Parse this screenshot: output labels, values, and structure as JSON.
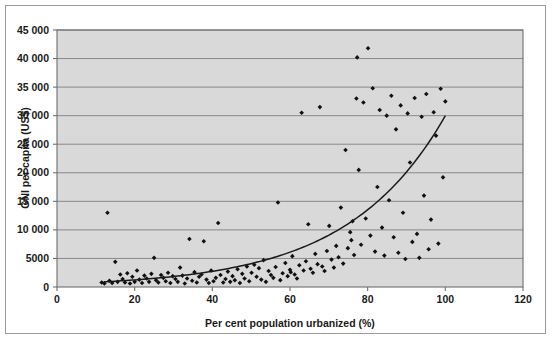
{
  "figure": {
    "background_color": "#ffffff",
    "border_color": "#9a9a9a",
    "plot_background_color": "#d9d9d9",
    "gridline_color": "#808080",
    "axis_color": "#6e6e6e",
    "marker_color": "#101010",
    "trendline_color": "#1a1a1a"
  },
  "chart_data": {
    "type": "scatter",
    "title": "",
    "xlabel": "Per cent population urbanized (%)",
    "ylabel": "GNI per capita (US$)",
    "xlim": [
      0,
      120
    ],
    "ylim": [
      0,
      45000
    ],
    "xticks": [
      0,
      20,
      40,
      60,
      80,
      100,
      120
    ],
    "xtick_labels": [
      "0",
      "20",
      "40",
      "60",
      "80",
      "100",
      "120"
    ],
    "yticks": [
      0,
      5000,
      10000,
      15000,
      20000,
      25000,
      30000,
      35000,
      40000,
      45000
    ],
    "ytick_labels": [
      "0",
      "5000",
      "10 000",
      "15 000",
      "20 000",
      "25 000",
      "30 000",
      "35 000",
      "40 000",
      "45 000"
    ],
    "grid": "horizontal",
    "legend": "none",
    "marker": "diamond",
    "series": [
      {
        "name": "Countries",
        "points": [
          [
            11.5,
            800
          ],
          [
            12.2,
            600
          ],
          [
            13.0,
            13000
          ],
          [
            13.5,
            1100
          ],
          [
            14.2,
            700
          ],
          [
            15.0,
            4400
          ],
          [
            15.6,
            900
          ],
          [
            16.3,
            2200
          ],
          [
            16.9,
            1400
          ],
          [
            17.5,
            800
          ],
          [
            18.1,
            2400
          ],
          [
            18.8,
            600
          ],
          [
            19.4,
            1800
          ],
          [
            20.0,
            900
          ],
          [
            20.6,
            2900
          ],
          [
            21.2,
            1300
          ],
          [
            21.9,
            700
          ],
          [
            22.5,
            2000
          ],
          [
            23.1,
            1500
          ],
          [
            23.7,
            900
          ],
          [
            24.3,
            2300
          ],
          [
            25.0,
            5100
          ],
          [
            25.5,
            1200
          ],
          [
            26.1,
            800
          ],
          [
            26.8,
            2100
          ],
          [
            27.4,
            1600
          ],
          [
            28.0,
            1000
          ],
          [
            28.6,
            2500
          ],
          [
            29.2,
            700
          ],
          [
            29.8,
            1900
          ],
          [
            30.5,
            1400
          ],
          [
            31.1,
            900
          ],
          [
            31.7,
            3400
          ],
          [
            32.3,
            2000
          ],
          [
            32.9,
            600
          ],
          [
            33.5,
            1500
          ],
          [
            34.1,
            8400
          ],
          [
            34.8,
            1100
          ],
          [
            35.4,
            2600
          ],
          [
            36.0,
            800
          ],
          [
            36.6,
            1800
          ],
          [
            37.2,
            2200
          ],
          [
            37.8,
            8000
          ],
          [
            38.5,
            1300
          ],
          [
            39.1,
            700
          ],
          [
            39.7,
            2900
          ],
          [
            40.3,
            1000
          ],
          [
            40.9,
            1600
          ],
          [
            41.5,
            11200
          ],
          [
            42.1,
            2100
          ],
          [
            42.8,
            800
          ],
          [
            43.4,
            1400
          ],
          [
            44.0,
            2700
          ],
          [
            44.6,
            900
          ],
          [
            45.2,
            1900
          ],
          [
            45.8,
            1200
          ],
          [
            46.5,
            3100
          ],
          [
            47.1,
            700
          ],
          [
            47.7,
            2300
          ],
          [
            48.3,
            1500
          ],
          [
            48.9,
            3600
          ],
          [
            49.5,
            1000
          ],
          [
            50.1,
            2500
          ],
          [
            50.8,
            3900
          ],
          [
            51.4,
            1800
          ],
          [
            52.0,
            3300
          ],
          [
            52.6,
            1300
          ],
          [
            53.2,
            4700
          ],
          [
            53.8,
            900
          ],
          [
            54.5,
            2800
          ],
          [
            55.1,
            2100
          ],
          [
            55.7,
            1600
          ],
          [
            56.3,
            3500
          ],
          [
            56.9,
            14800
          ],
          [
            57.5,
            1200
          ],
          [
            58.1,
            2400
          ],
          [
            58.8,
            4200
          ],
          [
            59.4,
            1900
          ],
          [
            60.0,
            3000
          ],
          [
            60.2,
            2600
          ],
          [
            60.6,
            5400
          ],
          [
            61.2,
            2200
          ],
          [
            61.8,
            1500
          ],
          [
            62.4,
            3800
          ],
          [
            63.0,
            30500
          ],
          [
            63.5,
            2900
          ],
          [
            64.1,
            4500
          ],
          [
            64.7,
            11000
          ],
          [
            65.3,
            3200
          ],
          [
            65.9,
            2500
          ],
          [
            66.5,
            5800
          ],
          [
            67.1,
            4000
          ],
          [
            67.7,
            31500
          ],
          [
            68.3,
            3600
          ],
          [
            68.9,
            2800
          ],
          [
            69.5,
            6300
          ],
          [
            70.1,
            10700
          ],
          [
            70.7,
            4800
          ],
          [
            71.3,
            3400
          ],
          [
            71.9,
            7200
          ],
          [
            72.5,
            5200
          ],
          [
            73.1,
            13900
          ],
          [
            73.7,
            4100
          ],
          [
            74.3,
            24000
          ],
          [
            74.9,
            6800
          ],
          [
            75.5,
            9600
          ],
          [
            75.8,
            8200
          ],
          [
            76.1,
            11500
          ],
          [
            76.5,
            5600
          ],
          [
            77.1,
            33000
          ],
          [
            77.3,
            40200
          ],
          [
            77.7,
            20500
          ],
          [
            78.3,
            7400
          ],
          [
            78.9,
            32300
          ],
          [
            79.5,
            12000
          ],
          [
            80.1,
            41800
          ],
          [
            80.7,
            9000
          ],
          [
            81.3,
            34800
          ],
          [
            81.9,
            6200
          ],
          [
            82.5,
            17500
          ],
          [
            83.1,
            31000
          ],
          [
            83.7,
            10400
          ],
          [
            84.3,
            5500
          ],
          [
            84.9,
            30000
          ],
          [
            85.5,
            15200
          ],
          [
            86.1,
            33500
          ],
          [
            86.7,
            8700
          ],
          [
            87.3,
            27600
          ],
          [
            87.9,
            6000
          ],
          [
            88.5,
            31800
          ],
          [
            89.1,
            13000
          ],
          [
            89.7,
            4900
          ],
          [
            90.3,
            30400
          ],
          [
            90.9,
            21800
          ],
          [
            91.5,
            7900
          ],
          [
            92.1,
            33100
          ],
          [
            92.7,
            9300
          ],
          [
            93.3,
            5100
          ],
          [
            93.9,
            29800
          ],
          [
            94.5,
            16000
          ],
          [
            95.1,
            33800
          ],
          [
            95.7,
            6600
          ],
          [
            96.3,
            11800
          ],
          [
            97.0,
            30600
          ],
          [
            97.6,
            26500
          ],
          [
            98.2,
            7600
          ],
          [
            98.8,
            34700
          ],
          [
            99.4,
            19200
          ],
          [
            100.0,
            32500
          ]
        ]
      }
    ],
    "trendline": {
      "type": "exponential",
      "description": "exponential best fit curve",
      "x_start": 12,
      "x_end": 100,
      "y_start": 900,
      "y_end": 30000
    }
  }
}
